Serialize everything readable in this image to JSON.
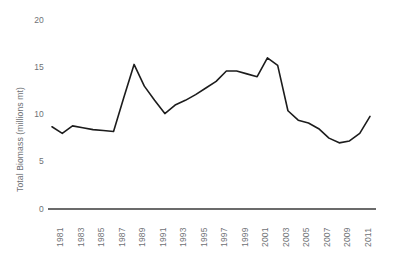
{
  "chart_data": {
    "type": "line",
    "title": "",
    "subtitle": "",
    "xlabel": "",
    "ylabel": "Total Biomass (millions mt)",
    "x": [
      1981,
      1982,
      1983,
      1984,
      1985,
      1986,
      1987,
      1988,
      1989,
      1990,
      1991,
      1992,
      1993,
      1994,
      1995,
      1996,
      1997,
      1998,
      1999,
      2000,
      2001,
      2002,
      2003,
      2004,
      2005,
      2006,
      2007,
      2008,
      2009,
      2010,
      2011,
      2012
    ],
    "values": [
      8.7,
      8.0,
      8.8,
      8.6,
      8.4,
      8.3,
      8.2,
      11.8,
      15.3,
      13.0,
      11.5,
      10.1,
      11.0,
      11.5,
      12.1,
      12.8,
      13.5,
      14.6,
      14.6,
      14.3,
      14.0,
      16.0,
      15.2,
      10.4,
      9.4,
      9.1,
      8.5,
      7.5,
      7.0,
      7.2,
      8.0,
      9.8
    ],
    "series": [
      {
        "name": "Total Biomass",
        "values": [
          8.7,
          8.0,
          8.8,
          8.6,
          8.4,
          8.3,
          8.2,
          11.8,
          15.3,
          13.0,
          11.5,
          10.1,
          11.0,
          11.5,
          12.1,
          12.8,
          13.5,
          14.6,
          14.6,
          14.3,
          14.0,
          16.0,
          15.2,
          10.4,
          9.4,
          9.1,
          8.5,
          7.5,
          7.0,
          7.2,
          8.0,
          9.8
        ],
        "color": "#1c1c1c"
      }
    ],
    "xlim": [
      1981,
      2012
    ],
    "ylim": [
      0,
      20
    ],
    "y_ticks": [
      "0",
      "5",
      "10",
      "15",
      "20"
    ],
    "y_tick_values": [
      0,
      5,
      10,
      15,
      20
    ],
    "x_ticks": [
      "1981",
      "1983",
      "1985",
      "1987",
      "1989",
      "1991",
      "1993",
      "1995",
      "1997",
      "1999",
      "2001",
      "2003",
      "2005",
      "2007",
      "2009",
      "2011"
    ],
    "x_tick_values": [
      1981,
      1983,
      1985,
      1987,
      1989,
      1991,
      1993,
      1995,
      1997,
      1999,
      2001,
      2003,
      2005,
      2007,
      2009,
      2011
    ],
    "grid": false,
    "legend": "none",
    "annotations": []
  },
  "style": {
    "line_color": "#1c1c1c",
    "axis_color": "#3a3a3a",
    "label_color": "#6f7276",
    "background": "#ffffff"
  }
}
